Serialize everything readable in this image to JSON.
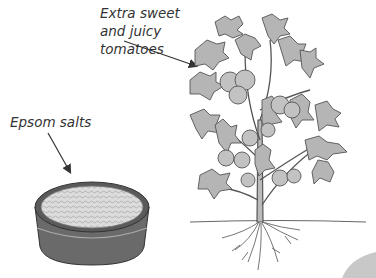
{
  "labels": {
    "tomatoes": [
      "Extra sweet",
      "and juicy",
      "tomatoes"
    ],
    "epsom": "Epsom salts"
  },
  "colors": {
    "leaf": "#b5b5b5",
    "fruit": "#c2c2c2",
    "outline": "#555555",
    "bowl": "#666666",
    "salt": "#d8d8d8",
    "text": "#333333"
  }
}
